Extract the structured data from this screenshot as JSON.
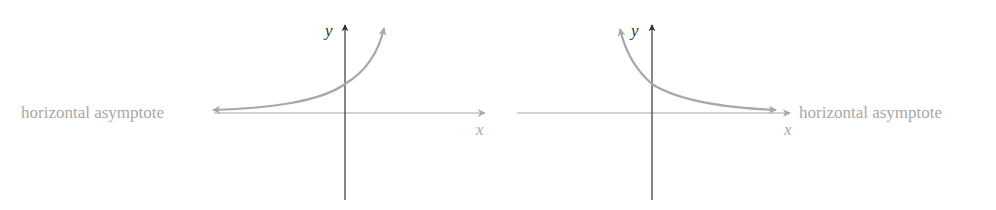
{
  "graphs": [
    {
      "name": "exponential-growth",
      "asymptote_label": "horizontal asymptote",
      "x_label": "x",
      "y_label": "y"
    },
    {
      "name": "exponential-decay",
      "asymptote_label": "horizontal asymptote",
      "x_label": "x",
      "y_label": "y"
    }
  ],
  "colors": {
    "axis_y": "#333333",
    "axis_x": "#a8a8a8",
    "curve": "#a8a8a8",
    "text": "#a8a8a8"
  }
}
